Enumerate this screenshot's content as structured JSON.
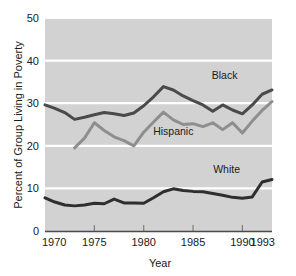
{
  "chart_data": {
    "type": "line",
    "title": "",
    "xlabel": "Year",
    "ylabel": "Percent of Group Living in Poverty",
    "xlim": [
      1970,
      1993
    ],
    "ylim": [
      0,
      50
    ],
    "xticks": [
      "1970",
      "1975",
      "1980",
      "1985",
      "1990",
      "1993"
    ],
    "xtick_values": [
      1970,
      1975,
      1980,
      1985,
      1990,
      1993
    ],
    "yticks": [
      "0",
      "10",
      "20",
      "30",
      "40",
      "50"
    ],
    "ytick_values": [
      0,
      10,
      20,
      30,
      40,
      50
    ],
    "grid": "horizontal",
    "legend_position": "inline-annotations",
    "plot_background": "#d2d2d2",
    "gridline_color": "#ffffff",
    "series": [
      {
        "name": "Black",
        "color": "#4a4a4a",
        "label_x": 1988.2,
        "label_y": 35.6,
        "x": [
          1970,
          1971,
          1972,
          1973,
          1974,
          1975,
          1976,
          1977,
          1978,
          1979,
          1980,
          1981,
          1982,
          1983,
          1984,
          1985,
          1986,
          1987,
          1988,
          1989,
          1990,
          1991,
          1992,
          1993
        ],
        "values": [
          29.6,
          28.8,
          27.8,
          26.2,
          26.7,
          27.3,
          27.8,
          27.5,
          27.1,
          27.7,
          29.4,
          31.5,
          33.9,
          33.1,
          31.7,
          30.6,
          29.6,
          28.1,
          29.6,
          28.4,
          27.5,
          29.6,
          32.1,
          33.1
        ]
      },
      {
        "name": "Hispanic",
        "color": "#8e8e8e",
        "label_x": 1983.0,
        "label_y": 22.6,
        "x": [
          1973,
          1974,
          1975,
          1976,
          1977,
          1978,
          1979,
          1980,
          1981,
          1982,
          1983,
          1984,
          1985,
          1986,
          1987,
          1988,
          1989,
          1990,
          1991,
          1992,
          1993
        ],
        "values": [
          19.5,
          21.8,
          25.4,
          23.6,
          22.1,
          21.2,
          20.0,
          23.2,
          25.6,
          27.9,
          26.1,
          25.0,
          25.2,
          24.5,
          25.4,
          23.8,
          25.4,
          23.0,
          25.8,
          28.3,
          30.4
        ]
      },
      {
        "name": "White",
        "color": "#2e2e2e",
        "label_x": 1988.4,
        "label_y": 13.6,
        "x": [
          1970,
          1971,
          1972,
          1973,
          1974,
          1975,
          1976,
          1977,
          1978,
          1979,
          1980,
          1981,
          1982,
          1983,
          1984,
          1985,
          1986,
          1987,
          1988,
          1989,
          1990,
          1991,
          1992,
          1993
        ],
        "values": [
          7.8,
          6.8,
          6.1,
          5.9,
          6.1,
          6.5,
          6.4,
          7.5,
          6.6,
          6.6,
          6.5,
          7.8,
          9.2,
          9.9,
          9.5,
          9.3,
          9.2,
          8.8,
          8.4,
          7.9,
          7.7,
          8.0,
          11.5,
          12.1
        ]
      }
    ]
  },
  "layout": {
    "plot_left": 45,
    "plot_right": 272,
    "plot_top": 18,
    "plot_bottom": 231
  }
}
